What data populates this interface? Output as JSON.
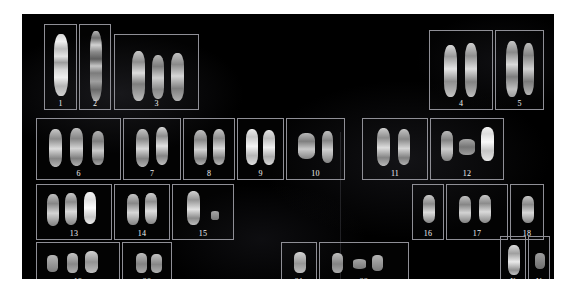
{
  "image": {
    "type": "karyotype-spread",
    "description": "Giemsa-banded human karyogram arranged in numbered boxes on a black background",
    "background_color": "#000000",
    "box_border_color": "#8f8f96",
    "label_color": "#f2f2f2",
    "chromosome_color_light": "#e8e8e8",
    "chromosome_color_mid": "#9a9a9a",
    "chromosome_color_dark": "#4a4a4a"
  },
  "rows": [
    {
      "name": "row-1",
      "cells": [
        {
          "label": "1",
          "x": 22,
          "y": 10,
          "w": 33,
          "h": 86,
          "count": 1
        },
        {
          "label": "2",
          "x": 57,
          "y": 10,
          "w": 32,
          "h": 86,
          "count": 1
        },
        {
          "label": "3",
          "x": 92,
          "y": 20,
          "w": 85,
          "h": 76,
          "count": 3
        },
        {
          "label": "4",
          "x": 407,
          "y": 16,
          "w": 64,
          "h": 80,
          "count": 2
        },
        {
          "label": "5",
          "x": 473,
          "y": 16,
          "w": 49,
          "h": 80,
          "count": 2
        }
      ]
    },
    {
      "name": "row-2",
      "cells": [
        {
          "label": "6",
          "x": 14,
          "y": 104,
          "w": 85,
          "h": 62,
          "count": 3
        },
        {
          "label": "7",
          "x": 101,
          "y": 104,
          "w": 58,
          "h": 62,
          "count": 2
        },
        {
          "label": "8",
          "x": 161,
          "y": 104,
          "w": 52,
          "h": 62,
          "count": 2
        },
        {
          "label": "9",
          "x": 215,
          "y": 104,
          "w": 47,
          "h": 62,
          "count": 2
        },
        {
          "label": "10",
          "x": 264,
          "y": 104,
          "w": 59,
          "h": 62,
          "count": 2
        },
        {
          "label": "11",
          "x": 340,
          "y": 104,
          "w": 66,
          "h": 62,
          "count": 2
        },
        {
          "label": "12",
          "x": 408,
          "y": 104,
          "w": 74,
          "h": 62,
          "count": 3
        }
      ]
    },
    {
      "name": "row-3",
      "cells": [
        {
          "label": "13",
          "x": 14,
          "y": 170,
          "w": 76,
          "h": 56,
          "count": 3
        },
        {
          "label": "14",
          "x": 92,
          "y": 170,
          "w": 56,
          "h": 56,
          "count": 2
        },
        {
          "label": "15",
          "x": 150,
          "y": 170,
          "w": 62,
          "h": 56,
          "count": 2
        },
        {
          "label": "16",
          "x": 390,
          "y": 170,
          "w": 32,
          "h": 56,
          "count": 1
        },
        {
          "label": "17",
          "x": 424,
          "y": 170,
          "w": 62,
          "h": 56,
          "count": 2
        },
        {
          "label": "18",
          "x": 488,
          "y": 170,
          "w": 34,
          "h": 56,
          "count": 1
        }
      ]
    },
    {
      "name": "row-4",
      "cells": [
        {
          "label": "19",
          "x": 14,
          "y": 228,
          "w": 84,
          "h": 46,
          "count": 3
        },
        {
          "label": "20",
          "x": 100,
          "y": 228,
          "w": 50,
          "h": 46,
          "count": 2
        },
        {
          "label": "21",
          "x": 259,
          "y": 228,
          "w": 36,
          "h": 46,
          "count": 1
        },
        {
          "label": "22",
          "x": 297,
          "y": 228,
          "w": 90,
          "h": 46,
          "count": 3
        },
        {
          "label": "X",
          "x": 478,
          "y": 222,
          "w": 26,
          "h": 52,
          "count": 1
        },
        {
          "label": "Y",
          "x": 506,
          "y": 222,
          "w": 22,
          "h": 52,
          "count": 1
        }
      ]
    }
  ],
  "labels": [
    "1",
    "2",
    "3",
    "4",
    "5",
    "6",
    "7",
    "8",
    "9",
    "10",
    "11",
    "12",
    "13",
    "14",
    "15",
    "16",
    "17",
    "18",
    "19",
    "20",
    "21",
    "22",
    "X",
    "Y"
  ]
}
